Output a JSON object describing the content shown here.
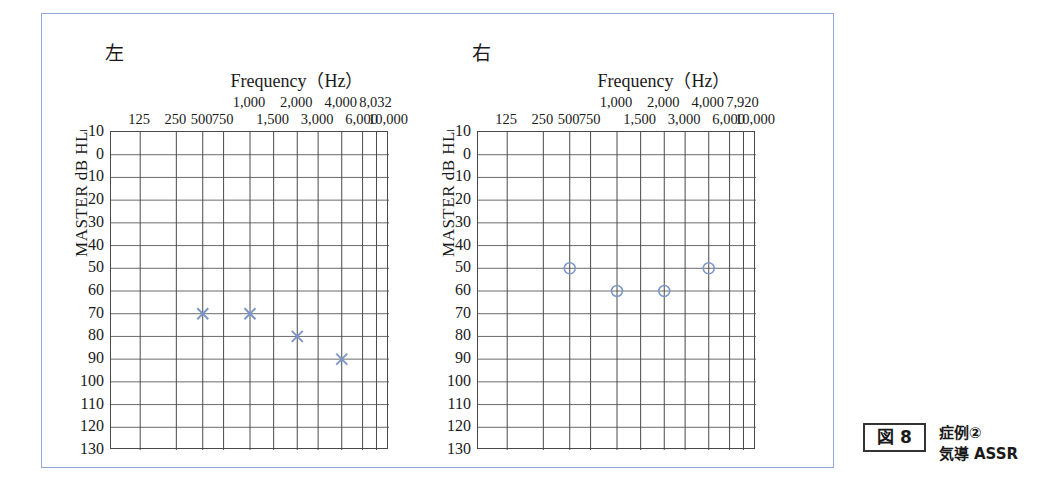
{
  "figure": {
    "caption_number": "図 8",
    "caption_line1": "症例②",
    "caption_line2": "気導 ASSR",
    "frame_color": "#8fa8d8"
  },
  "chart_data": [
    {
      "type": "scatter",
      "panel_label": "左",
      "panel_label_meaning": "left-ear",
      "title": "Frequency（Hz）",
      "xlabel": "Frequency（Hz）",
      "ylabel": "MASTER dB HL",
      "marker": "x",
      "marker_color": "#7b96c8",
      "grid": true,
      "ylim": [
        -10,
        130
      ],
      "yticks": [
        "−10",
        "0",
        "10",
        "20",
        "30",
        "40",
        "50",
        "60",
        "70",
        "80",
        "90",
        "100",
        "110",
        "120",
        "130"
      ],
      "ytick_values": [
        -10,
        0,
        10,
        20,
        30,
        40,
        50,
        60,
        70,
        80,
        90,
        100,
        110,
        120,
        130
      ],
      "xticks_lower": [
        "125",
        "250",
        "500",
        "750",
        "1,500",
        "3,000",
        "6,000",
        "10,000"
      ],
      "xticks_upper": [
        "1,000",
        "2,000",
        "4,000",
        "8,032"
      ],
      "xtick_all": [
        "125",
        "250",
        "500",
        "750",
        "1,000",
        "1,500",
        "2,000",
        "3,000",
        "4,000",
        "6,000",
        "8,032",
        "10,000"
      ],
      "x": [
        "500",
        "1,000",
        "2,000",
        "4,000"
      ],
      "values": [
        70,
        70,
        80,
        90
      ]
    },
    {
      "type": "scatter",
      "panel_label": "右",
      "panel_label_meaning": "right-ear",
      "title": "Frequency（Hz）",
      "xlabel": "Frequency（Hz）",
      "ylabel": "MASTER dB HL",
      "marker": "o",
      "marker_color": "#7b96c8",
      "grid": true,
      "ylim": [
        -10,
        130
      ],
      "yticks": [
        "−10",
        "0",
        "10",
        "20",
        "30",
        "40",
        "50",
        "60",
        "70",
        "80",
        "90",
        "100",
        "110",
        "120",
        "130"
      ],
      "ytick_values": [
        -10,
        0,
        10,
        20,
        30,
        40,
        50,
        60,
        70,
        80,
        90,
        100,
        110,
        120,
        130
      ],
      "xticks_lower": [
        "125",
        "250",
        "500",
        "750",
        "1,500",
        "3,000",
        "6,000",
        "10,000"
      ],
      "xticks_upper": [
        "1,000",
        "2,000",
        "4,000",
        "7,920"
      ],
      "xtick_all": [
        "125",
        "250",
        "500",
        "750",
        "1,000",
        "1,500",
        "2,000",
        "3,000",
        "4,000",
        "6,000",
        "7,920",
        "10,000"
      ],
      "x": [
        "500",
        "1,000",
        "2,000",
        "4,000"
      ],
      "values": [
        50,
        60,
        60,
        50
      ]
    }
  ]
}
